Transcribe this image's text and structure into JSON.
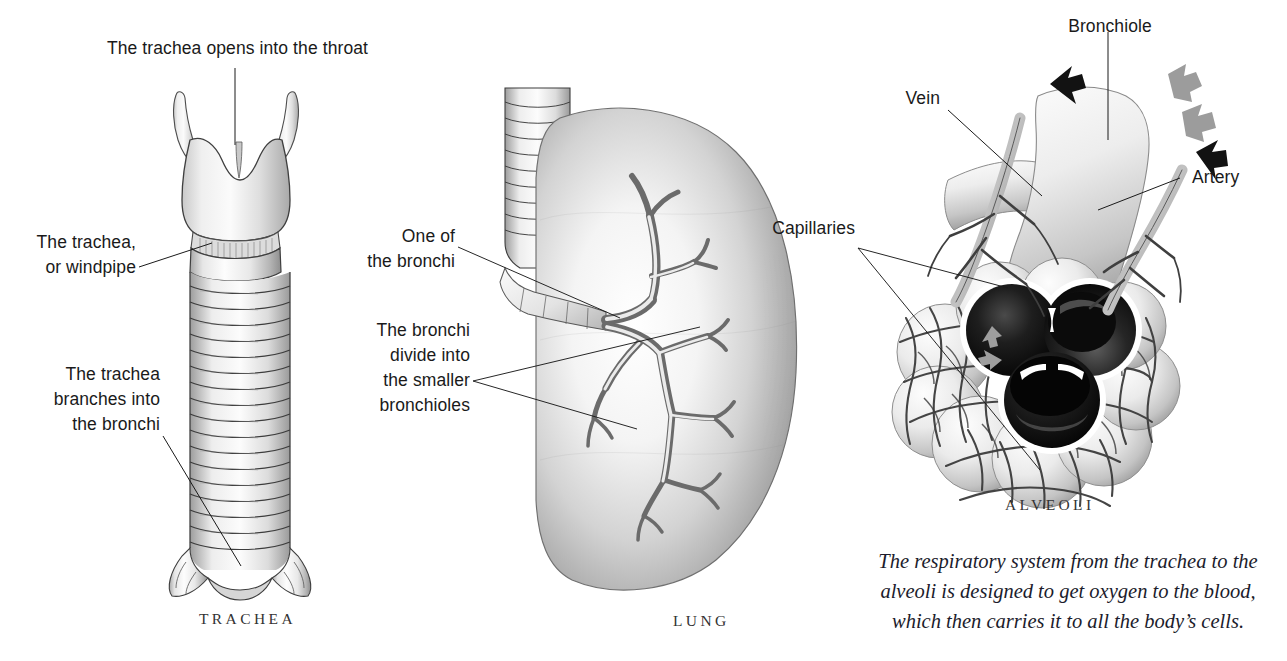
{
  "page": {
    "background_color": "#ffffff",
    "ink_color": "#1a1a1a",
    "width": 1287,
    "height": 661
  },
  "panels": {
    "trachea": {
      "caption": "TRACHEA",
      "labels": {
        "top": "The trachea opens into the throat",
        "middle": "The trachea,\nor windpipe",
        "bottom": "The trachea\nbranches into\nthe bronchi"
      }
    },
    "lung": {
      "caption": "LUNG",
      "labels": {
        "bronchi": "One of\nthe bronchi",
        "bronchioles": "The bronchi\ndivide into\nthe smaller\nbronchioles"
      }
    },
    "alveoli": {
      "caption": "ALVEOLI",
      "labels": {
        "bronchiole": "Bronchiole",
        "vein": "Vein",
        "artery": "Artery",
        "capillaries": "Capillaries"
      },
      "summary": "The respiratory system from the trachea to the\nalveoli is designed to get oxygen to the blood,\nwhich then carries it to all the body’s cells."
    }
  },
  "colors": {
    "line": "#1a1a1a",
    "tissue_light": "#f2f2f2",
    "tissue_mid": "#b9b9b9",
    "tissue_dark": "#6e6e6e",
    "vessel": "#4a4a4a",
    "airflow_arrow": "#9a9a9a",
    "blood_arrow": "#141414",
    "lumen_dark": "#050505"
  }
}
